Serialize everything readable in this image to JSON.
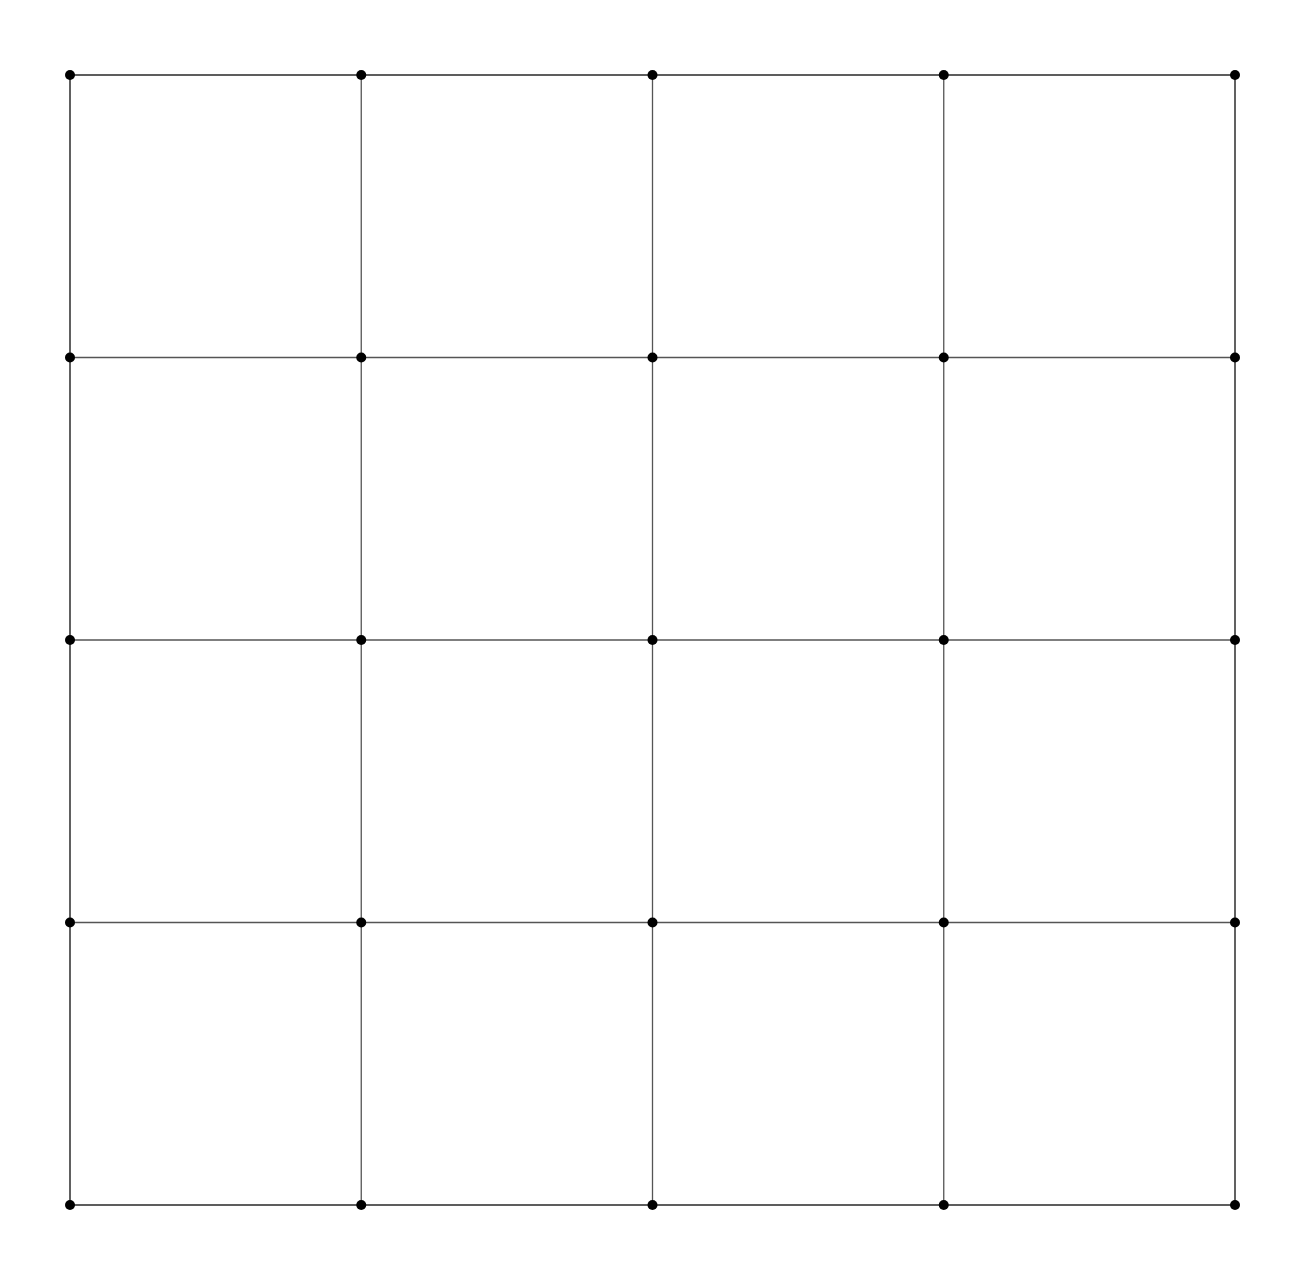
{
  "figure": {
    "kind": "mesh-diagram",
    "title": "",
    "background_color": "#ffffff",
    "canvas": {
      "width": 1309,
      "height": 1276
    }
  },
  "chart_data": {
    "type": "diagram",
    "subtype": "finite-element-mesh",
    "title": "",
    "xlabel": "",
    "ylabel": "",
    "grid": false,
    "legend": null,
    "domain": {
      "shape": "square",
      "left": 70,
      "top": 75,
      "right": 1235,
      "bottom": 1205,
      "outline_color": "#555555",
      "outline_width": 1.6
    },
    "mesh_style": {
      "edge_color": "#6b6b6b",
      "edge_width": 1.25,
      "hub_edge_color": "#555555",
      "hub_edge_width": 1.3,
      "node_color": "#222222",
      "hub_node_color": "#000000",
      "node_radius": 2.0,
      "hub_node_radius": 5.0,
      "fill": "none"
    },
    "structure": {
      "base_grid_divisions_x": 12,
      "base_grid_divisions_y": 12,
      "cell_pitch_x": 97.08,
      "cell_pitch_y": 94.17,
      "hub_stride": 3,
      "hub_fan_rays": 20,
      "diagonal_pattern": "x-cross-in-cells",
      "transition_ring": "octagonal-polygon-around-hub"
    },
    "hub_columns": [
      70,
      357.5,
      650,
      942.5,
      1235
    ],
    "hub_rows": [
      75,
      357.5,
      640,
      922.5,
      1205
    ],
    "grid_columns": [
      70,
      166.3,
      262.5,
      358.8,
      455,
      551.3,
      647.5,
      743.8,
      840,
      936.3,
      1032.5,
      1128.8,
      1235
    ],
    "grid_rows": [
      75,
      169.2,
      263.3,
      357.5,
      451.7,
      545.8,
      640,
      734.2,
      828.3,
      922.5,
      1016.7,
      1110.8,
      1205
    ]
  }
}
